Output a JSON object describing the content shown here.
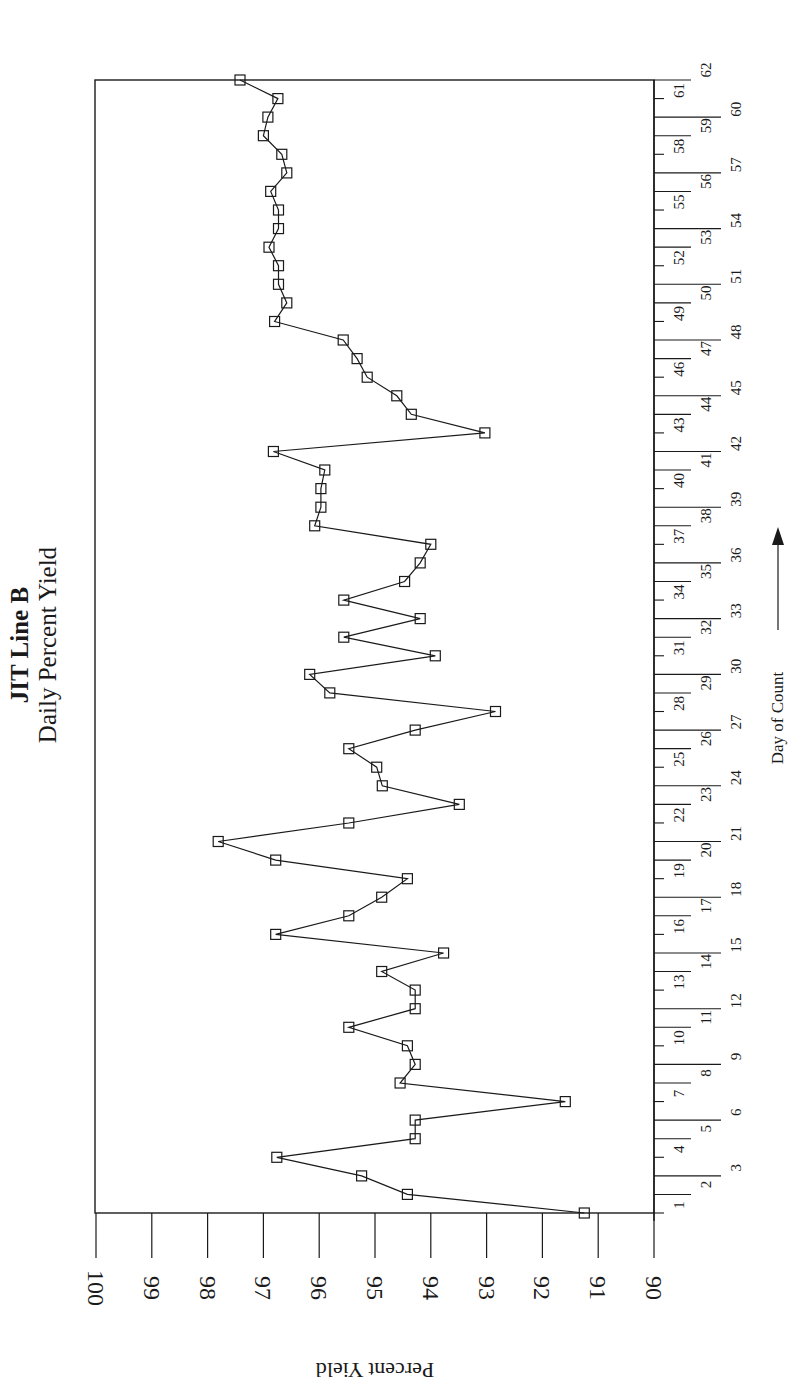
{
  "chart_data": {
    "type": "line",
    "title": "JIT Line B",
    "subtitle": "Daily Percent Yield",
    "xlabel": "Day of Count",
    "ylabel": "Percent Yield",
    "orientation": "rotated 90 degrees counter-clockwise (day axis vertical on right, yield axis horizontal along bottom)",
    "marker": "open-square",
    "line_color": "#1a1a1a",
    "grid": false,
    "legend": null,
    "xlim": [
      1,
      62
    ],
    "ylim": [
      90,
      100
    ],
    "y_ticks": [
      100,
      99,
      98,
      97,
      96,
      95,
      94,
      93,
      92,
      91,
      90
    ],
    "x_ticks": [
      1,
      2,
      3,
      4,
      5,
      6,
      7,
      8,
      9,
      10,
      11,
      12,
      13,
      14,
      15,
      16,
      17,
      18,
      19,
      20,
      21,
      22,
      23,
      24,
      25,
      26,
      27,
      28,
      29,
      30,
      31,
      32,
      33,
      34,
      35,
      36,
      37,
      38,
      39,
      40,
      41,
      42,
      43,
      44,
      45,
      46,
      47,
      48,
      49,
      50,
      51,
      52,
      53,
      54,
      55,
      56,
      57,
      58,
      59,
      60,
      61,
      62
    ],
    "x": [
      1,
      2,
      3,
      4,
      5,
      6,
      7,
      8,
      9,
      10,
      11,
      12,
      13,
      14,
      15,
      16,
      17,
      18,
      19,
      20,
      21,
      22,
      23,
      24,
      25,
      26,
      27,
      28,
      29,
      30,
      31,
      32,
      33,
      34,
      35,
      36,
      37,
      38,
      39,
      40,
      41,
      42,
      43,
      44,
      45,
      46,
      47,
      48,
      49,
      50,
      51,
      52,
      53,
      54,
      55,
      56,
      57,
      58,
      59,
      60,
      61,
      62
    ],
    "values": [
      91.25,
      94.42,
      95.24,
      96.76,
      94.28,
      94.28,
      91.59,
      94.55,
      94.28,
      94.42,
      95.47,
      94.28,
      94.28,
      94.88,
      93.77,
      96.78,
      95.47,
      94.88,
      94.42,
      96.78,
      97.81,
      95.47,
      93.49,
      94.87,
      94.97,
      95.47,
      94.28,
      92.84,
      95.81,
      96.17,
      93.92,
      95.56,
      94.19,
      95.56,
      94.47,
      94.19,
      94.0,
      96.08,
      95.97,
      95.97,
      95.9,
      96.82,
      93.03,
      94.35,
      94.61,
      95.14,
      95.32,
      95.57,
      96.8,
      96.58,
      96.73,
      96.73,
      96.9,
      96.73,
      96.73,
      96.87,
      96.58,
      96.67,
      97.0,
      96.92,
      96.74,
      97.42
    ],
    "series": [
      {
        "name": "Daily Percent Yield",
        "values": [
          91.25,
          94.42,
          95.24,
          96.76,
          94.28,
          94.28,
          91.59,
          94.55,
          94.28,
          94.42,
          95.47,
          94.28,
          94.28,
          94.88,
          93.77,
          96.78,
          95.47,
          94.88,
          94.42,
          96.78,
          97.81,
          95.47,
          93.49,
          94.87,
          94.97,
          95.47,
          94.28,
          92.84,
          95.81,
          96.17,
          93.92,
          95.56,
          94.19,
          95.56,
          94.47,
          94.19,
          94.0,
          96.08,
          95.97,
          95.97,
          95.9,
          96.82,
          93.03,
          94.35,
          94.61,
          95.14,
          95.32,
          95.57,
          96.8,
          96.58,
          96.73,
          96.73,
          96.9,
          96.73,
          96.73,
          96.87,
          96.58,
          96.67,
          97.0,
          96.92,
          96.74,
          97.42
        ]
      }
    ],
    "annotations": [
      {
        "text": "Day of Count",
        "arrow": "pointing toward increasing day"
      }
    ]
  },
  "layout": {
    "plot_left": 95,
    "plot_right": 654,
    "plot_top": 80,
    "plot_bottom": 1213,
    "yield_min_px": 654,
    "yield_max_px": 96,
    "day1_px": 1213,
    "day62_px": 80
  }
}
